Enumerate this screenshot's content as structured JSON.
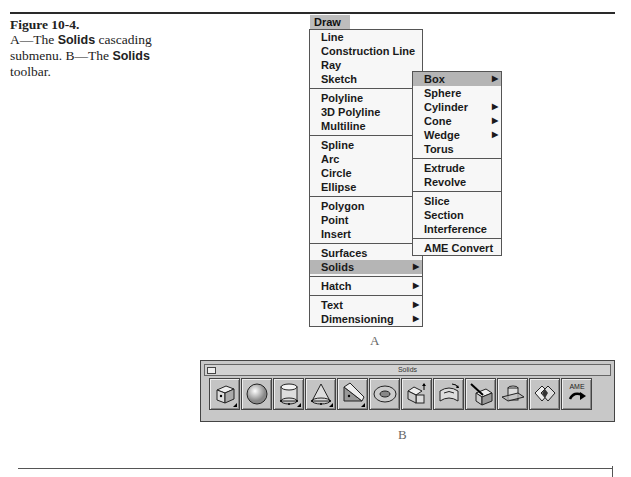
{
  "caption": {
    "title": "Figure 10-4.",
    "line_a_prefix": "A—The ",
    "line_a_bold": "Solids",
    "line_a_suffix": " cascading submenu. B—The ",
    "line_b_bold": "Solids",
    "line_b_suffix": " toolbar."
  },
  "menubar": {
    "label": "Draw"
  },
  "draw_menu": {
    "groups": [
      [
        {
          "label": "Line"
        },
        {
          "label": "Construction Line"
        },
        {
          "label": "Ray"
        },
        {
          "label": "Sketch"
        }
      ],
      [
        {
          "label": "Polyline"
        },
        {
          "label": "3D Polyline"
        },
        {
          "label": "Multiline"
        }
      ],
      [
        {
          "label": "Spline"
        },
        {
          "label": "Arc"
        },
        {
          "label": "Circle"
        },
        {
          "label": "Ellipse"
        }
      ],
      [
        {
          "label": "Polygon"
        },
        {
          "label": "Point"
        },
        {
          "label": "Insert"
        }
      ],
      [
        {
          "label": "Surfaces",
          "submenu": true
        },
        {
          "label": "Solids",
          "submenu": true,
          "highlighted": true
        }
      ],
      [
        {
          "label": "Hatch",
          "submenu": true
        }
      ],
      [
        {
          "label": "Text",
          "submenu": true
        },
        {
          "label": "Dimensioning",
          "submenu": true
        }
      ]
    ]
  },
  "solids_menu": {
    "groups": [
      [
        {
          "label": "Box",
          "submenu": true,
          "highlighted": true
        },
        {
          "label": "Sphere"
        },
        {
          "label": "Cylinder",
          "submenu": true
        },
        {
          "label": "Cone",
          "submenu": true
        },
        {
          "label": "Wedge",
          "submenu": true
        },
        {
          "label": "Torus"
        }
      ],
      [
        {
          "label": "Extrude"
        },
        {
          "label": "Revolve"
        }
      ],
      [
        {
          "label": "Slice"
        },
        {
          "label": "Section"
        },
        {
          "label": "Interference"
        }
      ],
      [
        {
          "label": "AME Convert"
        }
      ]
    ]
  },
  "labels": {
    "a": "A",
    "b": "B"
  },
  "toolbar": {
    "title": "Solids",
    "buttons": [
      {
        "name": "box-icon",
        "flyout": true
      },
      {
        "name": "sphere-icon",
        "flyout": false
      },
      {
        "name": "cylinder-icon",
        "flyout": true
      },
      {
        "name": "cone-icon",
        "flyout": true
      },
      {
        "name": "wedge-icon",
        "flyout": true
      },
      {
        "name": "torus-icon",
        "flyout": false
      },
      {
        "name": "extrude-icon",
        "flyout": false
      },
      {
        "name": "revolve-icon",
        "flyout": false
      },
      {
        "name": "slice-icon",
        "flyout": false
      },
      {
        "name": "section-icon",
        "flyout": false
      },
      {
        "name": "interference-icon",
        "flyout": false
      },
      {
        "name": "ame-convert-icon",
        "flyout": false,
        "text": "AME"
      }
    ]
  },
  "arrow_glyph": "▶"
}
